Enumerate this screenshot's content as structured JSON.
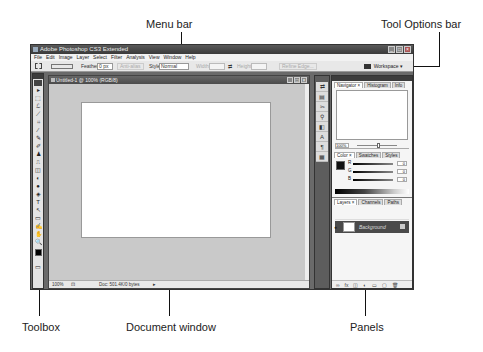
{
  "callouts": {
    "menu_bar": "Menu bar",
    "tool_options_bar": "Tool Options bar",
    "toolbox": "Toolbox",
    "document_window": "Document window",
    "panels": "Panels"
  },
  "app": {
    "title": "Adobe Photoshop CS3 Extended",
    "window_buttons": [
      "_",
      "□",
      "×"
    ]
  },
  "menubar": {
    "items": [
      "File",
      "Edit",
      "Image",
      "Layer",
      "Select",
      "Filter",
      "Analysis",
      "View",
      "Window",
      "Help"
    ]
  },
  "options_bar": {
    "feather_label": "Feather:",
    "feather_value": "0 px",
    "anti_alias_label": "Anti-alias",
    "style_label": "Style:",
    "style_value": "Normal",
    "width_label": "Width:",
    "height_label": "Height:",
    "refine_edge_label": "Refine Edge...",
    "workspace_label": "Workspace ▾"
  },
  "toolbox": {
    "tools": [
      "▸",
      "⬚",
      "ℒ",
      "⟋",
      "⌗",
      "⁄",
      "✎",
      "✐",
      "♟",
      "⎍",
      "◫",
      "◐",
      "●",
      "◈",
      "T",
      "↖",
      "▭",
      "✍",
      "✋",
      "🔍"
    ]
  },
  "document": {
    "title": "Untitled-1 @ 100% (RGB/8)",
    "zoom": "100%",
    "doc_size": "Doc: 501.4K/0 bytes"
  },
  "panels": {
    "dock_icons": [
      "⇄",
      "▤",
      "✂",
      "⚲",
      "◧",
      "A",
      "¶",
      "▦"
    ],
    "navigator_tabs": [
      "Navigator ×",
      "Histogram",
      "Info"
    ],
    "navigator_zoom": "100%",
    "color_tabs": [
      "Color ×",
      "Swatches",
      "Styles"
    ],
    "color_channels": [
      {
        "label": "R",
        "value": "0"
      },
      {
        "label": "G",
        "value": "0"
      },
      {
        "label": "B",
        "value": "0"
      }
    ],
    "layers_tabs": [
      "Layers ×",
      "Channels",
      "Paths"
    ],
    "layer_name": "Background",
    "footer_icons": [
      "∞",
      "fx",
      "◫",
      "◐",
      "▭",
      "▢",
      "🗑"
    ]
  }
}
